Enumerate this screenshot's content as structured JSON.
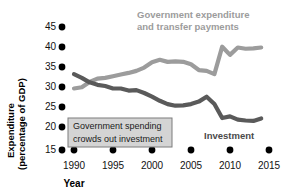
{
  "chart_data": {
    "type": "line",
    "title": "",
    "xlabel": "Year",
    "ylabel": "Expenditure (percentage of GDP)",
    "xlim": [
      1990,
      2015
    ],
    "ylim": [
      15,
      45
    ],
    "grid": false,
    "legend_position": "inline-labels",
    "x_ticks": [
      "1990",
      "1995",
      "2000",
      "2005",
      "2010",
      "2015"
    ],
    "y_ticks": [
      "15",
      "20",
      "25",
      "30",
      "35",
      "40",
      "45"
    ],
    "x": [
      1990,
      1991,
      1992,
      1993,
      1994,
      1995,
      1996,
      1997,
      1998,
      1999,
      2000,
      2001,
      2002,
      2003,
      2004,
      2005,
      2006,
      2007,
      2008,
      2009,
      2010,
      2011,
      2012,
      2013,
      2014
    ],
    "series": [
      {
        "name": "Government expenditure and transfer payments",
        "color": "#9c9c9c",
        "values": [
          30.0,
          30.3,
          31.6,
          32.4,
          32.6,
          33.0,
          33.4,
          33.8,
          34.3,
          35.1,
          36.4,
          37.0,
          36.5,
          36.6,
          36.5,
          35.9,
          34.5,
          34.3,
          33.5,
          40.2,
          38.2,
          40.0,
          39.7,
          39.8,
          40.0
        ]
      },
      {
        "name": "Investment",
        "color": "#5a5a5a",
        "values": [
          33.5,
          32.6,
          31.5,
          30.9,
          30.6,
          30.0,
          30.0,
          29.5,
          29.6,
          28.9,
          28.0,
          27.0,
          26.2,
          25.8,
          25.9,
          26.2,
          26.8,
          28.0,
          26.2,
          22.8,
          23.2,
          22.4,
          22.2,
          22.1,
          22.7
        ]
      }
    ],
    "annotations": [
      {
        "name": "crowding-out-note",
        "text_line_1": "Government spending",
        "text_line_2": "crowds out investment",
        "fill_color": "#d4d4d4",
        "border_color": "#7d7d7d"
      }
    ],
    "series_labels": [
      {
        "name": "government-expenditure-label",
        "line_1": "Government expenditure",
        "line_2": "and transfer payments",
        "color": "#9c9c9c"
      },
      {
        "name": "investment-label",
        "line_1": "Investment",
        "color": "#4a4a4a"
      }
    ],
    "tick_marker_color": "#000000"
  }
}
